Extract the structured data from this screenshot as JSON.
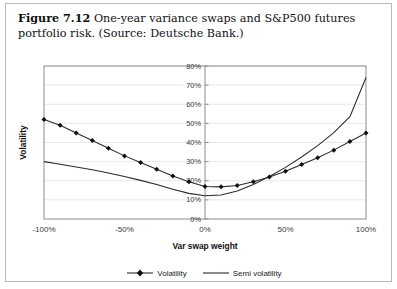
{
  "caption": {
    "figure_number": "Figure 7.12",
    "text": "One-year variance swaps and S&P500 futures portfolio risk. (Source: Deutsche Bank.)"
  },
  "legend": {
    "position": "bottom-center",
    "items": [
      {
        "label": "Volatility",
        "marker": "diamond",
        "color": "#2b2b2b"
      },
      {
        "label": "Semi volatility",
        "marker": "none",
        "color": "#2b2b2b"
      }
    ]
  },
  "chart_data": {
    "type": "line",
    "title": "",
    "xlabel": "Var swap weight",
    "ylabel": "Volatility",
    "xlim": [
      -100,
      100
    ],
    "ylim": [
      0,
      80
    ],
    "grid": true,
    "x_tick_labels": [
      "-100%",
      "-50%",
      "0%",
      "50%",
      "100%"
    ],
    "x_tick_values": [
      -100,
      -50,
      0,
      50,
      100
    ],
    "y_tick_labels": [
      "0%",
      "10%",
      "20%",
      "30%",
      "40%",
      "50%",
      "60%",
      "70%",
      "80%"
    ],
    "y_tick_values": [
      0,
      10,
      20,
      30,
      40,
      50,
      60,
      70,
      80
    ],
    "x": [
      -100,
      -90,
      -80,
      -70,
      -60,
      -50,
      -40,
      -30,
      -20,
      -10,
      0,
      10,
      20,
      30,
      40,
      50,
      60,
      70,
      80,
      90,
      100
    ],
    "series": [
      {
        "name": "Volatility",
        "marker": "diamond",
        "values": [
          52,
          49,
          45,
          41,
          37,
          33,
          29.5,
          26,
          22.5,
          19.5,
          17,
          16.8,
          17.5,
          19.5,
          22,
          25,
          28.5,
          32,
          36,
          40.5,
          45
        ]
      },
      {
        "name": "Semi volatility",
        "marker": "none",
        "values": [
          30,
          28.6,
          27.2,
          25.7,
          24,
          22.2,
          20.2,
          18,
          15.6,
          13.4,
          12.2,
          12.6,
          14.6,
          18,
          22.2,
          27,
          32.4,
          38.4,
          45.2,
          53.5,
          74
        ]
      }
    ]
  }
}
